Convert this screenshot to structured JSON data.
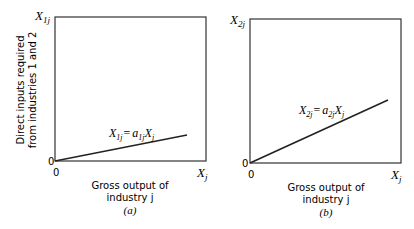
{
  "panels": [
    {
      "id": "a",
      "caption": "(a)",
      "y_axis_label": "X1j",
      "y_axis_main": "X",
      "y_axis_sub": "1j",
      "x_axis_label_main": "X",
      "x_axis_label_sub": "j",
      "origin_y": "0",
      "origin_x": "0",
      "xlabel_line1": "Gross output of",
      "xlabel_line2": "industry j",
      "equation": "X1j = a1j Xj",
      "eq_parts": {
        "X1": "X",
        "s1": "1j",
        "eq": "=",
        "a": "a",
        "s2": "1j",
        "X2": "X",
        "s3": "j"
      }
    },
    {
      "id": "b",
      "caption": "(b)",
      "y_axis_label": "X2j",
      "y_axis_main": "X",
      "y_axis_sub": "2j",
      "x_axis_label_main": "X",
      "x_axis_label_sub": "j",
      "origin_y": "0",
      "origin_x": "0",
      "xlabel_line1": "Gross output of",
      "xlabel_line2": "industry j",
      "equation": "X2j = a2j Xj",
      "eq_parts": {
        "X1": "X",
        "s1": "2j",
        "eq": "=",
        "a": "a",
        "s2": "2j",
        "X2": "X",
        "s3": "j"
      }
    }
  ],
  "shared_ylabel_line1": "Direct inputs required",
  "shared_ylabel_line2": "from industries 1 and 2",
  "colors": {
    "line": "#222222",
    "axis": "#333333",
    "background": "#ffffff"
  }
}
